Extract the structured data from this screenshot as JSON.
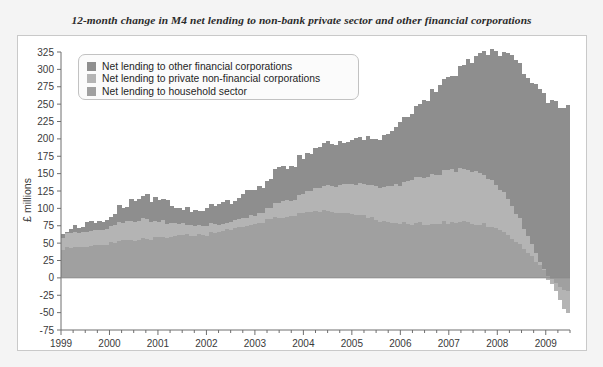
{
  "title": "12-month change in M4 net lending to non-bank private sector and other financial corporations",
  "axis": {
    "ylabel": "£ millions",
    "yticks": [
      "325",
      "300",
      "275",
      "250",
      "225",
      "200",
      "175",
      "150",
      "125",
      "100",
      "75",
      "50",
      "25",
      "0",
      "-25",
      "-50",
      "-75"
    ],
    "xticks": [
      "1999",
      "2000",
      "2001",
      "2002",
      "2003",
      "2004",
      "2005",
      "2006",
      "2007",
      "2008",
      "2009"
    ]
  },
  "legend": {
    "items": [
      {
        "label": "Net lending to other financial corporations",
        "color": "#8e8e8e"
      },
      {
        "label": "Net lending to private non-financial corporations",
        "color": "#b4b4b4"
      },
      {
        "label": "Net lending to household sector",
        "color": "#a0a0a0"
      }
    ]
  },
  "chart_data": {
    "type": "bar",
    "stacked": true,
    "title": "12-month change in M4 net lending to non-bank private sector and other financial corporations",
    "xlabel": "",
    "ylabel": "£ millions",
    "ylim": [
      -75,
      325
    ],
    "ytick_step": 25,
    "grid": false,
    "legend_position": "top-left-inside",
    "x_start_year": 1999,
    "x_end_year": 2009.75,
    "x_frequency": "monthly",
    "categories": [
      "1999 Q1",
      "1999 Q2",
      "1999 Q3",
      "1999 Q4",
      "2000 Q1",
      "2000 Q2",
      "2000 Q3",
      "2000 Q4",
      "2001 Q1",
      "2001 Q2",
      "2001 Q3",
      "2001 Q4",
      "2002 Q1",
      "2002 Q2",
      "2002 Q3",
      "2002 Q4",
      "2003 Q1",
      "2003 Q2",
      "2003 Q3",
      "2003 Q4",
      "2004 Q1",
      "2004 Q2",
      "2004 Q3",
      "2004 Q4",
      "2005 Q1",
      "2005 Q2",
      "2005 Q3",
      "2005 Q4",
      "2006 Q1",
      "2006 Q2",
      "2006 Q3",
      "2006 Q4",
      "2007 Q1",
      "2007 Q2",
      "2007 Q3",
      "2007 Q4",
      "2008 Q1",
      "2008 Q2",
      "2008 Q3",
      "2008 Q4",
      "2009 Q1",
      "2009 Q2",
      "2009 Q3"
    ],
    "series": [
      {
        "name": "Net lending to household sector",
        "color": "#a0a0a0",
        "values": [
          42,
          43,
          45,
          47,
          50,
          53,
          55,
          57,
          58,
          59,
          60,
          61,
          63,
          66,
          70,
          74,
          78,
          83,
          87,
          90,
          93,
          95,
          96,
          95,
          92,
          88,
          84,
          81,
          79,
          78,
          78,
          79,
          80,
          80,
          79,
          77,
          72,
          62,
          48,
          30,
          10,
          -8,
          -20
        ]
      },
      {
        "name": "Net lending to private non-financial corporations",
        "color": "#b4b4b4",
        "values": [
          18,
          19,
          20,
          21,
          23,
          26,
          28,
          27,
          24,
          20,
          16,
          13,
          11,
          10,
          10,
          11,
          13,
          16,
          20,
          24,
          28,
          32,
          36,
          39,
          42,
          45,
          48,
          52,
          57,
          63,
          68,
          72,
          75,
          77,
          76,
          72,
          64,
          52,
          36,
          18,
          2,
          -14,
          -32
        ]
      },
      {
        "name": "Net lending to other financial corporations",
        "color": "#8e8e8e",
        "values": [
          5,
          8,
          12,
          14,
          18,
          24,
          30,
          34,
          32,
          28,
          24,
          22,
          24,
          27,
          30,
          34,
          38,
          42,
          46,
          50,
          54,
          58,
          60,
          62,
          64,
          66,
          70,
          76,
          86,
          98,
          110,
          122,
          134,
          146,
          158,
          172,
          190,
          208,
          222,
          236,
          248,
          252,
          244
        ]
      }
    ],
    "notes": [
      "Peak total reaches approximately 320 in early 2009",
      "Household and corporate lending turn negative in 2009, reaching about -60"
    ]
  }
}
